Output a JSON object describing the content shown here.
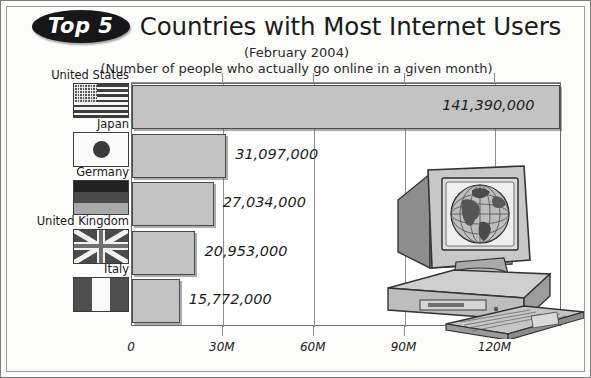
{
  "header": {
    "badge_label": "Top 5",
    "title": "Countries with Most Internet Users",
    "subtitle_date": "(February 2004)",
    "subtitle_note": "(Number of people who actually go online in a given month)"
  },
  "colors": {
    "bar_fill": "#c3c3c3",
    "bar_stroke": "#4a4a4a",
    "badge_bg": "#17171a",
    "badge_text": "#ffffff",
    "frame": "#7d7d7d",
    "gridline": "#8e8e8e",
    "text": "#1b1b1b"
  },
  "chart_data": {
    "type": "bar",
    "orientation": "horizontal",
    "title": "Top 5 Countries with Most Internet Users",
    "subtitle": "(February 2004)",
    "annotation": "(Number of people who actually go online in a given month)",
    "xlabel": "",
    "ylabel": "",
    "categories": [
      "United States",
      "Japan",
      "Germany",
      "United Kingdom",
      "Italy"
    ],
    "values": [
      141390000,
      31097000,
      27034000,
      20953000,
      15772000
    ],
    "value_labels": [
      "141,390,000",
      "31,097,000",
      "27,034,000",
      "20,953,000",
      "15,772,000"
    ],
    "xlim": [
      0,
      142000000
    ],
    "xticks": [
      0,
      30000000,
      60000000,
      90000000,
      120000000
    ],
    "xtick_labels": [
      "0",
      "30M",
      "60M",
      "90M",
      "120M"
    ],
    "grid": true,
    "legend": "none"
  },
  "flags": [
    {
      "country": "United States",
      "icon": "flag-united-states-icon"
    },
    {
      "country": "Japan",
      "icon": "flag-japan-icon"
    },
    {
      "country": "Germany",
      "icon": "flag-germany-icon"
    },
    {
      "country": "United Kingdom",
      "icon": "flag-united-kingdom-icon"
    },
    {
      "country": "Italy",
      "icon": "flag-italy-icon"
    }
  ],
  "illustration": {
    "name": "desktop-computer-with-globe-icon",
    "parts": [
      "crt-monitor",
      "globe-on-screen",
      "desktop-case",
      "keyboard"
    ]
  }
}
